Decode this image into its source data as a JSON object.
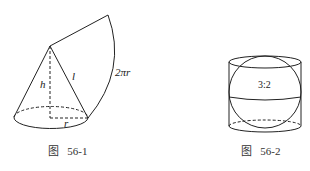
{
  "figures": [
    {
      "id": "56-1",
      "caption": "图   56-1",
      "labels": {
        "height": "h",
        "slant": "l",
        "radius": "r",
        "arc": "2πr"
      },
      "description": "Cone with its lateral surface unrolled into a sector"
    },
    {
      "id": "56-2",
      "caption": "图   56-2",
      "labels": {
        "ratio": "3:2"
      },
      "description": "Sphere inscribed in a cylinder"
    }
  ]
}
